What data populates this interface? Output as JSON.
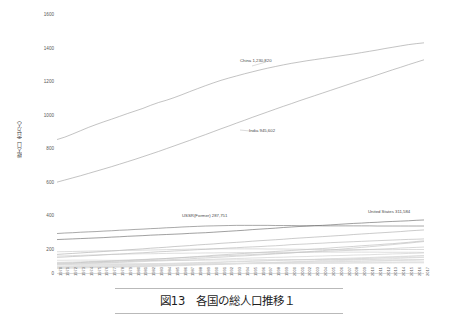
{
  "figure": {
    "caption": "図13　各国の総人口推移１"
  },
  "chart_data": {
    "type": "line",
    "title": "",
    "xlabel": "",
    "ylabel": "総人口（百万人）",
    "ylim": [
      0,
      1600
    ],
    "yticks": [
      "0",
      "200",
      "400",
      "600",
      "800",
      "1000",
      "1200",
      "1400",
      "1600"
    ],
    "grid": false,
    "legend_position": "inline-annotations",
    "x": [
      "1970",
      "1971",
      "1972",
      "1973",
      "1974",
      "1975",
      "1976",
      "1977",
      "1978",
      "1979",
      "1980",
      "1981",
      "1982",
      "1983",
      "1984",
      "1985",
      "1986",
      "1987",
      "1988",
      "1989",
      "1990",
      "1991",
      "1992",
      "1993",
      "1994",
      "1995",
      "1996",
      "1997",
      "1998",
      "1999",
      "2000",
      "2001",
      "2002",
      "2003",
      "2004",
      "2005",
      "2006",
      "2007",
      "2008",
      "2009",
      "2010",
      "2011",
      "2012",
      "2013",
      "2014",
      "2015",
      "2016",
      "2017"
    ],
    "annotations": [
      {
        "name": "china-annotation",
        "text": "China 1,230,820",
        "x": 1992,
        "y": 1180
      },
      {
        "name": "india-annotation",
        "text": "India 945,602",
        "x": 1993,
        "y": 860
      },
      {
        "name": "ussr-annotation",
        "text": "USSR(Former) 287,751",
        "x": 1984,
        "y": 300
      },
      {
        "name": "united-states-annotation",
        "text": "United States 311,584",
        "x": 2012,
        "y": 320
      }
    ],
    "series": [
      {
        "name": "China",
        "color": "#9a9a9a",
        "values": [
          818,
          833,
          852,
          872,
          892,
          910,
          927,
          943,
          960,
          977,
          993,
          1009,
          1028,
          1045,
          1059,
          1075,
          1093,
          1112,
          1130,
          1148,
          1165,
          1181,
          1195,
          1208,
          1221,
          1233,
          1245,
          1256,
          1266,
          1276,
          1285,
          1293,
          1301,
          1308,
          1315,
          1322,
          1329,
          1336,
          1343,
          1351,
          1359,
          1367,
          1376,
          1384,
          1392,
          1400,
          1406,
          1411
        ]
      },
      {
        "name": "India",
        "color": "#9a9a9a",
        "values": [
          557,
          570,
          583,
          596,
          610,
          624,
          638,
          652,
          667,
          682,
          697,
          713,
          729,
          745,
          762,
          779,
          796,
          813,
          831,
          848,
          866,
          884,
          901,
          919,
          936,
          954,
          971,
          988,
          1005,
          1022,
          1038,
          1055,
          1071,
          1087,
          1103,
          1119,
          1135,
          1151,
          1167,
          1183,
          1198,
          1214,
          1230,
          1246,
          1261,
          1277,
          1292,
          1307
        ]
      },
      {
        "name": "USSR (Former)",
        "color": "#6f6f6f",
        "values": [
          242,
          245,
          247,
          250,
          252,
          254,
          257,
          259,
          262,
          264,
          267,
          269,
          272,
          274,
          277,
          279,
          282,
          284,
          286,
          288,
          289,
          290,
          291,
          292,
          292,
          292,
          292,
          292,
          291,
          291,
          291,
          290,
          290,
          290,
          289,
          289,
          289,
          289,
          289,
          289,
          289,
          288,
          288,
          288,
          288,
          288,
          288,
          288
        ]
      },
      {
        "name": "United States",
        "color": "#5f5f5f",
        "values": [
          205,
          207,
          209,
          211,
          213,
          215,
          217,
          220,
          222,
          225,
          227,
          229,
          232,
          234,
          236,
          238,
          240,
          243,
          245,
          247,
          250,
          253,
          256,
          259,
          262,
          266,
          269,
          272,
          275,
          279,
          282,
          285,
          287,
          290,
          292,
          295,
          298,
          301,
          304,
          306,
          309,
          311,
          314,
          316,
          318,
          320,
          323,
          325
        ]
      },
      {
        "name": "Indonesia",
        "color": "#a8a8a8",
        "values": [
          114,
          117,
          120,
          123,
          126,
          129,
          132,
          135,
          138,
          142,
          145,
          148,
          152,
          155,
          158,
          162,
          165,
          168,
          172,
          175,
          178,
          182,
          185,
          188,
          191,
          195,
          198,
          201,
          204,
          207,
          211,
          214,
          217,
          220,
          223,
          226,
          229,
          232,
          236,
          239,
          242,
          245,
          248,
          251,
          254,
          258,
          261,
          264
        ]
      },
      {
        "name": "Brazil",
        "color": "#b0b0b0",
        "values": [
          96,
          98,
          101,
          103,
          106,
          108,
          111,
          114,
          116,
          119,
          122,
          124,
          127,
          130,
          132,
          135,
          137,
          140,
          143,
          145,
          148,
          150,
          153,
          155,
          158,
          160,
          162,
          165,
          167,
          170,
          174,
          176,
          178,
          181,
          183,
          186,
          188,
          190,
          192,
          194,
          196,
          198,
          200,
          202,
          204,
          206,
          207,
          209
        ]
      },
      {
        "name": "Pakistan",
        "color": "#b6b6b6",
        "values": [
          59,
          61,
          62,
          64,
          66,
          68,
          70,
          72,
          74,
          76,
          79,
          81,
          84,
          86,
          89,
          92,
          95,
          98,
          101,
          104,
          108,
          111,
          114,
          117,
          120,
          123,
          126,
          129,
          132,
          135,
          138,
          141,
          144,
          147,
          150,
          153,
          157,
          160,
          163,
          167,
          170,
          173,
          177,
          180,
          184,
          188,
          193,
          197
        ]
      },
      {
        "name": "Nigeria",
        "color": "#bcbcbc",
        "values": [
          55,
          57,
          58,
          60,
          61,
          63,
          65,
          66,
          68,
          70,
          72,
          74,
          76,
          78,
          80,
          83,
          85,
          87,
          90,
          92,
          95,
          97,
          100,
          103,
          105,
          108,
          111,
          114,
          117,
          120,
          123,
          127,
          130,
          134,
          137,
          141,
          145,
          149,
          153,
          157,
          161,
          165,
          170,
          174,
          179,
          183,
          188,
          193
        ]
      },
      {
        "name": "Bangladesh",
        "color": "#c0c0c0",
        "values": [
          65,
          66,
          67,
          68,
          70,
          71,
          73,
          75,
          77,
          79,
          81,
          83,
          85,
          87,
          89,
          91,
          94,
          96,
          98,
          100,
          103,
          105,
          107,
          109,
          111,
          113,
          116,
          118,
          120,
          122,
          124,
          126,
          128,
          130,
          132,
          134,
          136,
          138,
          140,
          142,
          144,
          146,
          148,
          150,
          153,
          155,
          157,
          159
        ]
      },
      {
        "name": "Russia",
        "color": "#c4c4c4",
        "values": [
          130,
          131,
          132,
          133,
          134,
          135,
          136,
          137,
          138,
          139,
          139,
          140,
          141,
          142,
          143,
          144,
          145,
          146,
          147,
          147,
          148,
          148,
          148,
          148,
          148,
          148,
          148,
          147,
          147,
          147,
          146,
          146,
          145,
          145,
          144,
          144,
          143,
          143,
          143,
          143,
          143,
          143,
          143,
          143,
          144,
          144,
          144,
          144
        ]
      },
      {
        "name": "Japan",
        "color": "#c8c8c8",
        "values": [
          104,
          105,
          107,
          108,
          110,
          111,
          113,
          114,
          115,
          116,
          117,
          118,
          118,
          119,
          120,
          121,
          121,
          122,
          122,
          123,
          123,
          124,
          124,
          125,
          125,
          125,
          126,
          126,
          126,
          127,
          127,
          127,
          127,
          128,
          128,
          128,
          128,
          128,
          128,
          128,
          128,
          128,
          127,
          127,
          127,
          127,
          127,
          126
        ]
      },
      {
        "name": "Mexico",
        "color": "#cacaca",
        "values": [
          51,
          53,
          54,
          56,
          58,
          59,
          61,
          63,
          65,
          66,
          68,
          70,
          72,
          73,
          75,
          77,
          78,
          80,
          81,
          83,
          84,
          86,
          87,
          89,
          90,
          92,
          93,
          95,
          96,
          97,
          99,
          100,
          101,
          103,
          104,
          106,
          107,
          108,
          110,
          111,
          112,
          114,
          115,
          117,
          118,
          120,
          121,
          123
        ]
      },
      {
        "name": "Germany",
        "color": "#cccccc",
        "values": [
          78,
          78,
          79,
          79,
          79,
          79,
          78,
          78,
          78,
          78,
          78,
          78,
          78,
          78,
          78,
          77,
          77,
          77,
          78,
          78,
          79,
          80,
          80,
          81,
          81,
          81,
          82,
          82,
          82,
          82,
          82,
          82,
          82,
          82,
          82,
          82,
          82,
          82,
          82,
          82,
          81,
          80,
          80,
          81,
          81,
          82,
          82,
          83
        ]
      },
      {
        "name": "Philippines",
        "color": "#cfcfcf",
        "values": [
          36,
          37,
          38,
          39,
          41,
          42,
          43,
          45,
          46,
          47,
          49,
          50,
          52,
          53,
          55,
          56,
          58,
          59,
          61,
          62,
          64,
          65,
          67,
          68,
          70,
          72,
          73,
          75,
          76,
          78,
          80,
          81,
          83,
          84,
          86,
          88,
          89,
          91,
          92,
          94,
          95,
          97,
          99,
          100,
          102,
          103,
          105,
          107
        ]
      },
      {
        "name": "Vietnam",
        "color": "#d1d1d1",
        "values": [
          43,
          44,
          45,
          46,
          47,
          48,
          49,
          51,
          52,
          53,
          54,
          55,
          57,
          58,
          59,
          60,
          62,
          63,
          64,
          66,
          67,
          68,
          70,
          71,
          72,
          74,
          75,
          76,
          78,
          79,
          80,
          81,
          82,
          83,
          84,
          85,
          86,
          87,
          88,
          89,
          90,
          91,
          92,
          93,
          94,
          95,
          96,
          97
        ]
      },
      {
        "name": "Egypt",
        "color": "#d3d3d3",
        "values": [
          33,
          34,
          35,
          36,
          36,
          37,
          38,
          39,
          40,
          41,
          42,
          43,
          45,
          46,
          47,
          48,
          49,
          51,
          52,
          53,
          55,
          56,
          57,
          58,
          60,
          61,
          62,
          63,
          65,
          66,
          67,
          69,
          70,
          71,
          73,
          74,
          76,
          77,
          79,
          81,
          82,
          84,
          86,
          88,
          90,
          92,
          94,
          96
        ]
      },
      {
        "name": "Ethiopia",
        "color": "#d5d5d5",
        "values": [
          28,
          29,
          30,
          31,
          32,
          33,
          34,
          35,
          36,
          37,
          38,
          39,
          40,
          42,
          43,
          44,
          45,
          47,
          48,
          50,
          51,
          53,
          55,
          56,
          58,
          60,
          62,
          63,
          65,
          67,
          69,
          71,
          73,
          75,
          77,
          79,
          81,
          83,
          86,
          88,
          90,
          92,
          95,
          97,
          99,
          102,
          104,
          106
        ]
      },
      {
        "name": "Turkey",
        "color": "#d7d7d7",
        "values": [
          35,
          36,
          37,
          37,
          38,
          39,
          40,
          41,
          42,
          43,
          44,
          45,
          46,
          47,
          48,
          49,
          50,
          51,
          52,
          53,
          54,
          55,
          56,
          57,
          58,
          59,
          60,
          61,
          62,
          63,
          64,
          65,
          66,
          67,
          67,
          68,
          69,
          70,
          71,
          72,
          73,
          74,
          75,
          76,
          77,
          78,
          79,
          81
        ]
      },
      {
        "name": "Iran",
        "color": "#d9d9d9",
        "values": [
          28,
          29,
          30,
          31,
          32,
          33,
          34,
          35,
          37,
          38,
          39,
          41,
          42,
          44,
          45,
          47,
          49,
          50,
          52,
          54,
          56,
          57,
          58,
          59,
          60,
          61,
          62,
          63,
          63,
          64,
          65,
          66,
          66,
          67,
          68,
          69,
          70,
          71,
          72,
          73,
          74,
          75,
          76,
          77,
          78,
          79,
          80,
          81
        ]
      },
      {
        "name": "France",
        "color": "#dbdbdb",
        "values": [
          51,
          51,
          52,
          52,
          53,
          53,
          53,
          53,
          54,
          54,
          54,
          54,
          55,
          55,
          55,
          55,
          56,
          56,
          56,
          57,
          57,
          57,
          58,
          58,
          58,
          58,
          59,
          59,
          59,
          59,
          59,
          60,
          60,
          61,
          61,
          62,
          62,
          62,
          63,
          63,
          63,
          64,
          64,
          64,
          65,
          65,
          65,
          65
        ]
      },
      {
        "name": "United Kingdom",
        "color": "#dddddd",
        "values": [
          56,
          56,
          56,
          56,
          56,
          56,
          56,
          56,
          56,
          56,
          56,
          56,
          56,
          56,
          56,
          57,
          57,
          57,
          57,
          57,
          57,
          57,
          58,
          58,
          58,
          58,
          58,
          58,
          59,
          59,
          59,
          59,
          59,
          60,
          60,
          60,
          61,
          61,
          62,
          62,
          63,
          63,
          64,
          64,
          65,
          65,
          66,
          66
        ]
      },
      {
        "name": "Italy",
        "color": "#dfdfdf",
        "values": [
          54,
          54,
          54,
          55,
          55,
          55,
          56,
          56,
          56,
          56,
          56,
          56,
          57,
          57,
          57,
          57,
          57,
          57,
          57,
          57,
          57,
          57,
          57,
          57,
          57,
          57,
          57,
          57,
          57,
          57,
          57,
          57,
          57,
          58,
          58,
          59,
          59,
          59,
          60,
          60,
          60,
          60,
          60,
          60,
          61,
          61,
          61,
          61
        ]
      },
      {
        "name": "Thailand",
        "color": "#e0e0e0",
        "values": [
          37,
          38,
          39,
          40,
          41,
          42,
          43,
          44,
          45,
          46,
          47,
          48,
          49,
          50,
          51,
          52,
          53,
          54,
          55,
          55,
          56,
          57,
          58,
          58,
          59,
          60,
          60,
          61,
          62,
          62,
          63,
          63,
          64,
          64,
          65,
          65,
          66,
          66,
          67,
          67,
          67,
          68,
          68,
          68,
          69,
          69,
          69,
          69
        ]
      }
    ]
  }
}
